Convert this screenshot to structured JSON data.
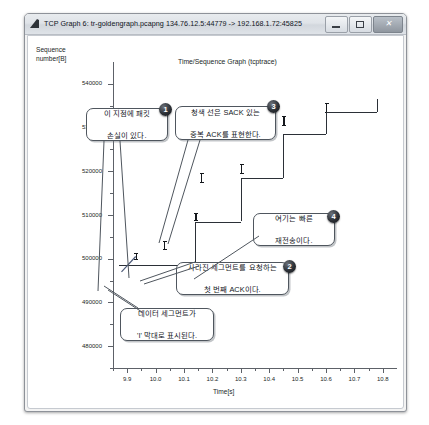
{
  "window": {
    "title": "TCP Graph 6: tr-goldengraph.pcapng 134.76.12.5:44779 -> 192.168.1.72:45825",
    "icon": "wireshark-icon",
    "controls": {
      "minimize_label": "–",
      "maximize_label": "□",
      "close_label": "×"
    }
  },
  "chart_data": {
    "type": "line",
    "title": "Time/Sequence Graph (tcptrace)",
    "xlabel": "Time[s]",
    "ylabel": "Sequence number[B]",
    "xlim": [
      9.85,
      10.85
    ],
    "ylim": [
      475000,
      545000
    ],
    "grid": false,
    "legend_position": "none",
    "x_ticks": [
      "9.9",
      "10.0",
      "10.1",
      "10.2",
      "10.3",
      "10.4",
      "10.5",
      "10.6",
      "10.7",
      "10.8"
    ],
    "x_tick_values": [
      9.9,
      10.0,
      10.1,
      10.2,
      10.3,
      10.4,
      10.5,
      10.6,
      10.7,
      10.8
    ],
    "y_ticks": [
      "540000",
      "530000",
      "520000",
      "510000",
      "500000",
      "490000",
      "480000"
    ],
    "y_tick_values": [
      540000,
      530000,
      520000,
      510000,
      500000,
      490000,
      480000
    ],
    "series": [
      {
        "name": "data segments (I-bars)",
        "type": "scatter",
        "marker": "I-bar",
        "points": [
          {
            "x": 9.93,
            "y": 500500,
            "height": 1800
          },
          {
            "x": 10.03,
            "y": 503000,
            "height": 2000
          },
          {
            "x": 10.14,
            "y": 509500,
            "height": 2000
          },
          {
            "x": 10.16,
            "y": 518500,
            "height": 2200
          },
          {
            "x": 10.3,
            "y": 520500,
            "height": 2200
          },
          {
            "x": 10.32,
            "y": 529000,
            "height": 2400
          },
          {
            "x": 10.45,
            "y": 531500,
            "height": 2200
          },
          {
            "x": 10.6,
            "y": 534500,
            "height": 2400
          }
        ]
      },
      {
        "name": "ACK line (stepped)",
        "type": "step",
        "x": [
          9.87,
          9.93,
          10.14,
          10.3,
          10.45,
          10.6,
          10.78
        ],
        "y": [
          498500,
          498500,
          508500,
          518500,
          528500,
          533500,
          536500
        ]
      },
      {
        "name": "duplicate ACK with SACK",
        "type": "line",
        "color": "#4c5a78",
        "x": [
          9.88,
          9.93
        ],
        "y": [
          497000,
          500500
        ]
      }
    ],
    "annotations": [
      {
        "id": "1",
        "text_lines": [
          "이 지점에 패킷",
          "손실이 있다."
        ]
      },
      {
        "id": "2",
        "text_lines": [
          "사라진 세그먼트를 요청하는",
          "첫 번째 ACK이다."
        ]
      },
      {
        "id": "3",
        "text_lines": [
          "청색 선은 SACK 있는",
          "중복 ACK를 표현한다."
        ]
      },
      {
        "id": "4",
        "text_lines": [
          "여기는 빠른",
          "재전송이다."
        ]
      },
      {
        "id": "",
        "text_lines": [
          "데이터 세그먼트가",
          "'I' 막대로 표시된다."
        ]
      }
    ]
  }
}
